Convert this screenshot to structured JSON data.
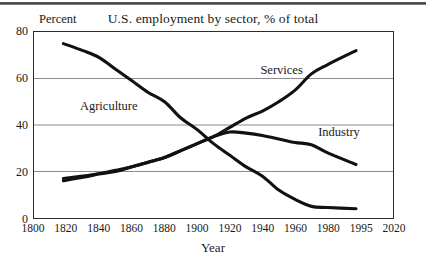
{
  "chart_data": {
    "type": "line",
    "title": "U.S. employment by sector, % of total",
    "xlabel": "Year",
    "ylabel": "Percent",
    "ylim": [
      0,
      80
    ],
    "yticks": [
      0,
      20,
      40,
      60,
      80
    ],
    "gridlines": [
      20,
      40,
      60
    ],
    "grid": true,
    "legend_position": "inline-annotations",
    "xtick_labels": [
      "1800",
      "1820",
      "1840",
      "1860",
      "1880",
      "1900",
      "1920",
      "1940",
      "1960",
      "1980",
      "1995",
      "2020"
    ],
    "xtick_values": [
      1800,
      1820,
      1840,
      1860,
      1880,
      1900,
      1920,
      1940,
      1960,
      1980,
      1995,
      2020
    ],
    "x_axis_note": "tick labels are evenly spaced; 1995 sits between 1980 and 2020",
    "series": [
      {
        "name": "Agriculture",
        "color": "#111111",
        "x": [
          1818,
          1830,
          1840,
          1850,
          1860,
          1870,
          1880,
          1890,
          1900,
          1910,
          1920,
          1930,
          1940,
          1950,
          1960,
          1970,
          1980,
          1993
        ],
        "values": [
          75,
          72,
          69,
          64,
          59,
          54,
          50,
          43,
          38,
          32,
          27,
          22,
          18,
          12,
          8,
          5,
          4.5,
          4
        ]
      },
      {
        "name": "Services",
        "color": "#111111",
        "x": [
          1818,
          1830,
          1840,
          1850,
          1860,
          1870,
          1880,
          1890,
          1900,
          1910,
          1920,
          1930,
          1940,
          1950,
          1960,
          1970,
          1980,
          1993
        ],
        "values": [
          17,
          18,
          19,
          20,
          22,
          24,
          26,
          29,
          32,
          35,
          39,
          43,
          46,
          50,
          55,
          62,
          66,
          72
        ]
      },
      {
        "name": "Industry",
        "color": "#111111",
        "x": [
          1818,
          1830,
          1840,
          1850,
          1860,
          1870,
          1880,
          1890,
          1900,
          1910,
          1920,
          1930,
          1940,
          1950,
          1960,
          1970,
          1980,
          1993
        ],
        "values": [
          16,
          17.5,
          19,
          20.5,
          22,
          24,
          26,
          29,
          32,
          35,
          37,
          36.5,
          35.5,
          34,
          32.5,
          31.5,
          28,
          23
        ]
      }
    ],
    "annotations": [
      {
        "label": "Agriculture",
        "x_pct": 13,
        "y_pct": 36
      },
      {
        "label": "Services",
        "x_pct": 63,
        "y_pct": 17
      },
      {
        "label": "Industry",
        "x_pct": 79,
        "y_pct": 50
      }
    ]
  }
}
